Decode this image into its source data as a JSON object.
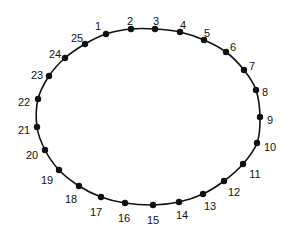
{
  "diagram": {
    "type": "closed-loop",
    "stroke_color": "#111111",
    "point_color": "#111111",
    "points": [
      {
        "label": "1",
        "x": 106,
        "y": 34,
        "lx": 98,
        "ly": 27,
        "anchor": "middle"
      },
      {
        "label": "2",
        "x": 131,
        "y": 29,
        "lx": 130,
        "ly": 22,
        "anchor": "middle"
      },
      {
        "label": "3",
        "x": 155,
        "y": 29,
        "lx": 156,
        "ly": 22,
        "anchor": "middle"
      },
      {
        "label": "4",
        "x": 180,
        "y": 32,
        "lx": 183,
        "ly": 26,
        "anchor": "middle"
      },
      {
        "label": "5",
        "x": 204,
        "y": 40,
        "lx": 207,
        "ly": 34,
        "anchor": "middle"
      },
      {
        "label": "6",
        "x": 226,
        "y": 52,
        "lx": 233,
        "ly": 48,
        "anchor": "middle"
      },
      {
        "label": "7",
        "x": 244,
        "y": 70,
        "lx": 252,
        "ly": 67,
        "anchor": "middle"
      },
      {
        "label": "8",
        "x": 256,
        "y": 90,
        "lx": 265,
        "ly": 93,
        "anchor": "middle"
      },
      {
        "label": "9",
        "x": 260,
        "y": 117,
        "lx": 270,
        "ly": 121,
        "anchor": "middle"
      },
      {
        "label": "10",
        "x": 257,
        "y": 143,
        "lx": 270,
        "ly": 148,
        "anchor": "middle"
      },
      {
        "label": "11",
        "x": 243,
        "y": 164,
        "lx": 255,
        "ly": 175,
        "anchor": "middle"
      },
      {
        "label": "12",
        "x": 224,
        "y": 181,
        "lx": 234,
        "ly": 193,
        "anchor": "middle"
      },
      {
        "label": "13",
        "x": 203,
        "y": 194,
        "lx": 210,
        "ly": 207,
        "anchor": "middle"
      },
      {
        "label": "14",
        "x": 179,
        "y": 202,
        "lx": 182,
        "ly": 216,
        "anchor": "middle"
      },
      {
        "label": "15",
        "x": 153,
        "y": 205,
        "lx": 153,
        "ly": 221,
        "anchor": "middle"
      },
      {
        "label": "16",
        "x": 125,
        "y": 203,
        "lx": 124,
        "ly": 219,
        "anchor": "middle"
      },
      {
        "label": "17",
        "x": 101,
        "y": 197,
        "lx": 96,
        "ly": 213,
        "anchor": "middle"
      },
      {
        "label": "18",
        "x": 79,
        "y": 186,
        "lx": 71,
        "ly": 200,
        "anchor": "middle"
      },
      {
        "label": "19",
        "x": 59,
        "y": 170,
        "lx": 47,
        "ly": 181,
        "anchor": "middle"
      },
      {
        "label": "20",
        "x": 45,
        "y": 150,
        "lx": 32,
        "ly": 156,
        "anchor": "middle"
      },
      {
        "label": "21",
        "x": 37,
        "y": 127,
        "lx": 24,
        "ly": 131,
        "anchor": "middle"
      },
      {
        "label": "22",
        "x": 38,
        "y": 99,
        "lx": 24,
        "ly": 103,
        "anchor": "middle"
      },
      {
        "label": "23",
        "x": 49,
        "y": 76,
        "lx": 37,
        "ly": 76,
        "anchor": "middle"
      },
      {
        "label": "24",
        "x": 65,
        "y": 58,
        "lx": 55,
        "ly": 55,
        "anchor": "middle"
      },
      {
        "label": "25",
        "x": 85,
        "y": 44,
        "lx": 77,
        "ly": 39,
        "anchor": "middle"
      }
    ]
  }
}
